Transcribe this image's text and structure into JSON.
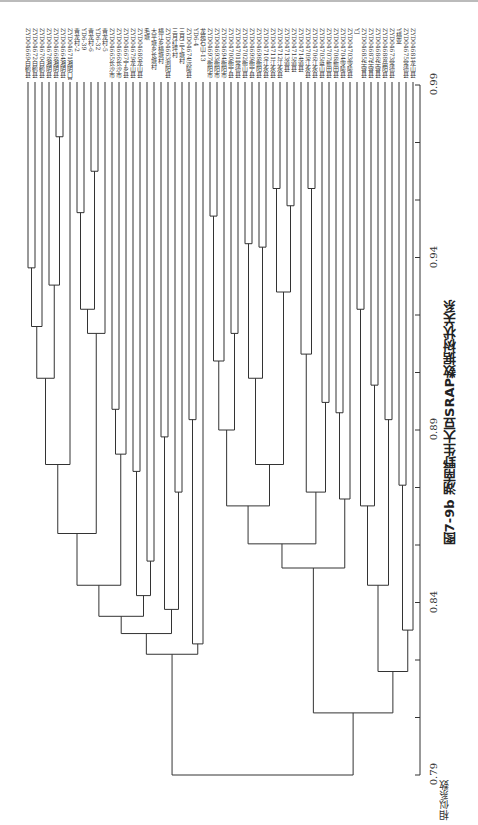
{
  "chart_data": {
    "type": "dendrogram",
    "title": "图7-9b 湖南野生大豆SRAP数据树状关系",
    "axis_label": "相似系数",
    "axis_ticks": [
      "0.99",
      "0.94",
      "0.89",
      "0.84",
      "0.79"
    ],
    "axis_range": [
      0.79,
      0.99
    ],
    "leaves": [
      "ZYD04669白鹤县",
      "ZYD04672白鹤县",
      "ZYD04670白鹤县",
      "ZYD04678湘阴县",
      "ZYD04668湘阴县",
      "ZYD04664湘阴县",
      "ZYD04671湘阴口县",
      "青龙村-2",
      "YD6-39",
      "青龙村-6",
      "YD6-32",
      "青龙村-5",
      "ZYD04665长沙市",
      "ZYD04666长沙市",
      "ZYD04667宁乡县",
      "ZYD04679龙山县",
      "ZYD04680龙山县",
      "毛塘",
      "大平塘乡长塘村",
      "横江乡横塘村",
      "ZYD04663浏阳县",
      "三月红坪村",
      "三月三下塘村",
      "ZYD04674沅陵县",
      "YD6-4",
      "龙苑石山-13",
      "ZYD04697衡阳市",
      "ZYD04693衡阳市",
      "ZYD04694衡阳市",
      "ZYD04700衡宁县",
      "ZYD04701常德县",
      "ZYD04702衡山县",
      "ZYD04699衡宁县",
      "ZYD04698衡阳县",
      "ZYD04710江永县",
      "ZYD04711江永县",
      "ZYD04712江永县",
      "ZYD04713道县",
      "ZYD04715道县",
      "ZYD04714道县",
      "ZYD04709江永县",
      "ZYD04706江永县",
      "ZYD04705蓝山县",
      "ZYD04707新田县",
      "ZYD04708新田县",
      "ZYD04704零陵县",
      "ZYD04703零陵县",
      "YJ",
      "ZYD04685华容县",
      "ZYD04687华容县",
      "ZYD04686华容县",
      "ZYD04688岳阳县",
      "ZYD04673常德县",
      "Y横亚",
      "ZYD04675常德县",
      "ZYD04681龙山县"
    ]
  },
  "figure": {
    "caption": "图7-9b 湖南野生大豆SRAP数据树状关系",
    "axis_title": "相似系数"
  }
}
